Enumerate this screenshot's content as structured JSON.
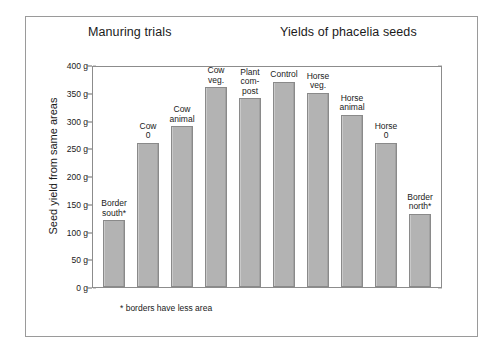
{
  "figure": {
    "title_left": "Manuring trials",
    "title_right": "Yields of phacelia seeds",
    "footnote": "* borders have less area"
  },
  "chart_data": {
    "type": "bar",
    "title": "Yields of phacelia seeds",
    "subtitle": "Manuring trials",
    "xlabel": "",
    "ylabel": "Seed yield from same areas",
    "ylim": [
      0,
      400
    ],
    "ytick_labels": [
      "400 g",
      "350 g",
      "300 g",
      "250 g",
      "200 g",
      "150 g",
      "100 g",
      "50 g",
      "0 g"
    ],
    "ytick_values": [
      400,
      350,
      300,
      250,
      200,
      150,
      100,
      50,
      0
    ],
    "ytick_interval": 50,
    "minor_tick_interval": 10,
    "grid": false,
    "legend": "none",
    "bar_color": "#b3b3b3",
    "bar_edge_color": "#8a8a8a",
    "annotation": "* borders have less area",
    "categories": [
      "Border south*",
      "Cow 0",
      "Cow animal",
      "Cow veg.",
      "Plant com-post",
      "Control",
      "Horse veg.",
      "Horse animal",
      "Horse 0",
      "Border north*"
    ],
    "values": [
      120,
      260,
      290,
      360,
      340,
      370,
      350,
      310,
      260,
      132
    ],
    "bars": [
      {
        "label_lines": [
          "Border",
          "south*"
        ],
        "value": 120
      },
      {
        "label_lines": [
          "Cow",
          "0"
        ],
        "value": 260
      },
      {
        "label_lines": [
          "Cow",
          "animal"
        ],
        "value": 290
      },
      {
        "label_lines": [
          "Cow",
          "veg."
        ],
        "value": 360
      },
      {
        "label_lines": [
          "Plant",
          "com-",
          "post"
        ],
        "value": 340
      },
      {
        "label_lines": [
          "Control"
        ],
        "value": 370
      },
      {
        "label_lines": [
          "Horse",
          "veg."
        ],
        "value": 350
      },
      {
        "label_lines": [
          "Horse",
          "animal"
        ],
        "value": 310
      },
      {
        "label_lines": [
          "Horse",
          "0"
        ],
        "value": 260
      },
      {
        "label_lines": [
          "Border",
          "north*"
        ],
        "value": 132
      }
    ]
  }
}
